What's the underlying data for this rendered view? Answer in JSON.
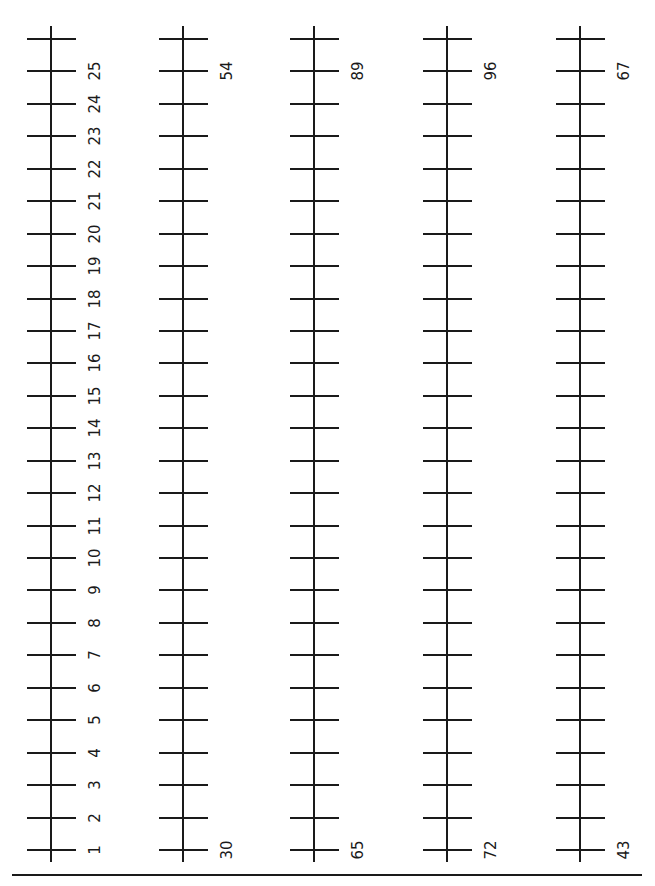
{
  "page": {
    "background": "#ffffff",
    "ink": "#1a1a1a"
  },
  "number_lines": [
    {
      "id": "line-1",
      "x": 51,
      "labels": [
        "1",
        "2",
        "3",
        "4",
        "5",
        "6",
        "7",
        "8",
        "9",
        "10",
        "11",
        "12",
        "13",
        "14",
        "15",
        "16",
        "17",
        "18",
        "19",
        "20",
        "21",
        "22",
        "23",
        "24",
        "25"
      ],
      "label_mode": "all"
    },
    {
      "id": "line-2",
      "x": 183,
      "start_label": "30",
      "end_label": "54",
      "label_mode": "ends"
    },
    {
      "id": "line-3",
      "x": 314,
      "start_label": "65",
      "end_label": "89",
      "label_mode": "ends"
    },
    {
      "id": "line-4",
      "x": 447,
      "start_label": "72",
      "end_label": "96",
      "label_mode": "ends"
    },
    {
      "id": "line-5",
      "x": 580,
      "start_label": "43",
      "end_label": "67",
      "label_mode": "ends"
    }
  ],
  "layout": {
    "axis_top": 26,
    "axis_bottom": 862,
    "first_tick_y": 850,
    "tick_spacing": 32.44,
    "tick_count": 26,
    "label_offset_x": 44,
    "bottom_rule": {
      "x1": 12,
      "x2": 642,
      "y": 874
    }
  }
}
